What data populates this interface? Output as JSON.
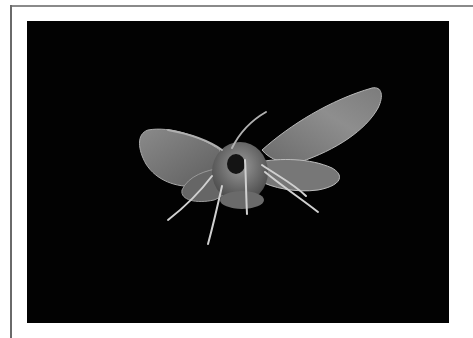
{
  "figure": {
    "alt": "Black-and-white photograph of a moth with spread wings against a black background",
    "background_color": "#020202",
    "frame_color": "#8a8a8a"
  }
}
